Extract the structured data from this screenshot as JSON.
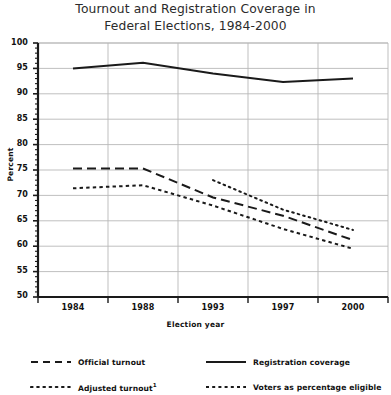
{
  "title": {
    "line1": "Tournout and Registration Coverage in",
    "line2": "Federal Elections, 1984-2000"
  },
  "axes": {
    "ylabel": "Percent",
    "xlabel": "Election year",
    "ytick_labels": [
      "100",
      "95",
      "90",
      "85",
      "80",
      "75",
      "70",
      "65",
      "60",
      "55",
      "50"
    ],
    "xtick_labels": [
      "1984",
      "1988",
      "1993",
      "1997",
      "2000"
    ]
  },
  "legend": {
    "items": [
      {
        "label": "Official turnout",
        "style": "dashed"
      },
      {
        "label": "Registration coverage",
        "style": "solid"
      },
      {
        "label": "Adjusted turnout",
        "style": "dotted",
        "footnote": "1"
      },
      {
        "label": "Voters as percentage eligible",
        "style": "short-dash"
      }
    ]
  },
  "colors": {
    "line": "#1a1a1a",
    "grid": "#b8b8b8",
    "axis": "#1a1a1a",
    "background": "#ffffff"
  },
  "chart_data": {
    "type": "line",
    "title": "Tournout and Registration Coverage in Federal Elections, 1984-2000",
    "xlabel": "Election year",
    "ylabel": "Percent",
    "ylim": [
      50,
      100
    ],
    "ytick_step": 5,
    "minor_ticks": true,
    "grid": true,
    "legend_position": "bottom",
    "categories": [
      "1984",
      "1988",
      "1993",
      "1997",
      "2000"
    ],
    "series": [
      {
        "name": "Registration coverage",
        "style": "solid",
        "values": [
          95.0,
          96.1,
          94.0,
          92.3,
          93.0
        ]
      },
      {
        "name": "Official turnout",
        "style": "dashed",
        "values": [
          75.3,
          75.3,
          69.6,
          66.0,
          61.2
        ]
      },
      {
        "name": "Adjusted turnout",
        "style": "dotted",
        "footnote": "1",
        "values": [
          null,
          null,
          73.0,
          67.2,
          63.2
        ]
      },
      {
        "name": "Voters as percentage eligible",
        "style": "short-dash",
        "values": [
          71.4,
          72.0,
          68.0,
          63.4,
          59.5
        ]
      }
    ]
  }
}
